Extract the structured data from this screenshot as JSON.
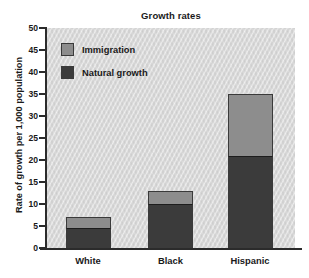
{
  "chart_data": {
    "type": "bar",
    "subtype": "stacked-vertical",
    "title": "Growth rates",
    "subtitle": "",
    "xlabel": "",
    "ylabel": "Rate of growth per 1,000 population",
    "categories": [
      "White",
      "Black",
      "Hispanic"
    ],
    "series": [
      {
        "name": "Natural growth",
        "values": [
          4.5,
          10,
          21
        ],
        "color": "#3b3b3b"
      },
      {
        "name": "Immigration",
        "values": [
          2.5,
          3,
          14
        ],
        "color": "#8d8d8d"
      }
    ],
    "totals": [
      7,
      13,
      35
    ],
    "stack_order": [
      "Natural growth",
      "Immigration"
    ],
    "ylim": [
      0,
      50
    ],
    "ytick_values": [
      0,
      5,
      10,
      15,
      20,
      25,
      30,
      35,
      40,
      45,
      50
    ],
    "ytick_labels": [
      "0",
      "5",
      "10",
      "15",
      "20",
      "25",
      "30",
      "35",
      "40",
      "45",
      "50"
    ],
    "grid": false,
    "legend_position": "top-left",
    "legend_entries": [
      "Immigration",
      "Natural growth"
    ],
    "plot_background": "#d3d3d3",
    "axis_color": "#2b2b2b"
  }
}
